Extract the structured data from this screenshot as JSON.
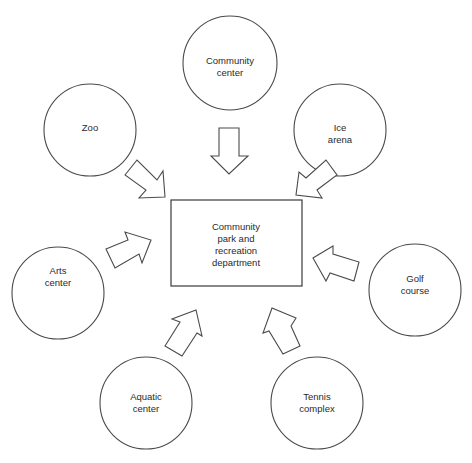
{
  "diagram": {
    "center": {
      "lines": [
        "Community",
        "park  and",
        "recreation",
        "department"
      ]
    },
    "nodes": [
      {
        "id": "community-center",
        "lines": [
          "Community",
          "center"
        ]
      },
      {
        "id": "zoo",
        "lines": [
          "Zoo"
        ]
      },
      {
        "id": "ice-arena",
        "lines": [
          "Ice",
          "arena"
        ]
      },
      {
        "id": "arts-center",
        "lines": [
          "Arts",
          "center"
        ]
      },
      {
        "id": "golf-course",
        "lines": [
          "Golf",
          "course"
        ]
      },
      {
        "id": "aquatic-center",
        "lines": [
          "Aquatic",
          "center"
        ]
      },
      {
        "id": "tennis-complex",
        "lines": [
          "Tennis",
          "complex"
        ]
      }
    ],
    "colors": {
      "stroke": "#4a4a4a",
      "text": "#2a2a2a",
      "background": "#ffffff"
    }
  }
}
